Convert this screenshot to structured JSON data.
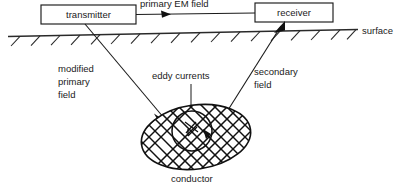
{
  "diagram": {
    "nodes": [
      {
        "id": "transmitter",
        "label": "transmitter"
      },
      {
        "id": "receiver",
        "label": "receiver"
      }
    ],
    "labels": {
      "primary_em_field": "primary EM field",
      "modified_primary_field_line1": "modified",
      "modified_primary_field_line2": "primary",
      "modified_primary_field_line3": "field",
      "eddy_currents": "eddy currents",
      "secondary_field_line1": "secondary",
      "secondary_field_line2": "field",
      "surface": "surface",
      "conductor": "conductor"
    },
    "colors": {
      "ink": "#1a1a1a",
      "surface": "#2a2a2a",
      "conductor_stroke": "#111111",
      "background": "#ffffff"
    }
  }
}
